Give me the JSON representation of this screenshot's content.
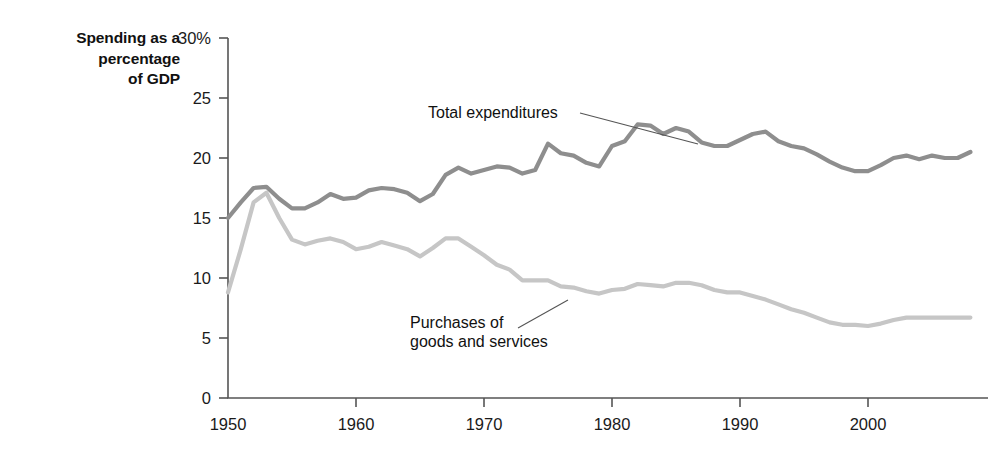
{
  "figure": {
    "axis_title": "Spending as a\npercentage\nof GDP"
  },
  "chart_data": {
    "type": "line",
    "title": "",
    "subtitle": "",
    "xlabel": "",
    "ylabel": "Spending as a percentage of GDP",
    "xlim": [
      1950,
      2008
    ],
    "ylim": [
      0,
      30
    ],
    "grid": false,
    "legend_position": "inline-annotations",
    "y_tick_labels": [
      "30%",
      "25",
      "20",
      "15",
      "10",
      "5",
      "0"
    ],
    "y_ticks": [
      30,
      25,
      20,
      15,
      10,
      5,
      0
    ],
    "x_tick_labels": [
      "1950",
      "1960",
      "1970",
      "1980",
      "1990",
      "2000"
    ],
    "x_ticks": [
      1950,
      1960,
      1970,
      1980,
      1990,
      2000
    ],
    "x": [
      1950,
      1951,
      1952,
      1953,
      1954,
      1955,
      1956,
      1957,
      1958,
      1959,
      1960,
      1961,
      1962,
      1963,
      1964,
      1965,
      1966,
      1967,
      1968,
      1969,
      1970,
      1971,
      1972,
      1973,
      1974,
      1975,
      1976,
      1977,
      1978,
      1979,
      1980,
      1981,
      1982,
      1983,
      1984,
      1985,
      1986,
      1987,
      1988,
      1989,
      1990,
      1991,
      1992,
      1993,
      1994,
      1995,
      1996,
      1997,
      1998,
      1999,
      2000,
      2001,
      2002,
      2003,
      2004,
      2005,
      2006,
      2007,
      2008
    ],
    "series": [
      {
        "name": "Total expenditures",
        "color": "#8e8e8e",
        "annotation": "Total expenditures",
        "values": [
          15.0,
          16.3,
          17.5,
          17.6,
          16.6,
          15.8,
          15.8,
          16.3,
          17.0,
          16.6,
          16.7,
          17.3,
          17.5,
          17.4,
          17.1,
          16.4,
          17.0,
          18.6,
          19.2,
          18.7,
          19.0,
          19.3,
          19.2,
          18.7,
          19.0,
          21.2,
          20.4,
          20.2,
          19.6,
          19.3,
          21.0,
          21.4,
          22.8,
          22.7,
          22.0,
          22.5,
          22.2,
          21.3,
          21.0,
          21.0,
          21.5,
          22.0,
          22.2,
          21.4,
          21.0,
          20.8,
          20.3,
          19.7,
          19.2,
          18.9,
          18.9,
          19.4,
          20.0,
          20.2,
          19.9,
          20.2,
          20.0,
          20.0,
          20.5
        ]
      },
      {
        "name": "Purchases of goods and services",
        "color": "#c6c6c6",
        "annotation": "Purchases of\ngoods and services",
        "values": [
          8.8,
          12.4,
          16.3,
          17.1,
          15.0,
          13.2,
          12.8,
          13.1,
          13.3,
          13.0,
          12.4,
          12.6,
          13.0,
          12.7,
          12.4,
          11.8,
          12.5,
          13.3,
          13.3,
          12.6,
          11.9,
          11.1,
          10.7,
          9.8,
          9.8,
          9.8,
          9.3,
          9.2,
          8.9,
          8.7,
          9.0,
          9.1,
          9.5,
          9.4,
          9.3,
          9.6,
          9.6,
          9.4,
          9.0,
          8.8,
          8.8,
          8.5,
          8.2,
          7.8,
          7.4,
          7.1,
          6.7,
          6.3,
          6.1,
          6.1,
          6.0,
          6.2,
          6.5,
          6.7,
          6.7,
          6.7,
          6.7,
          6.7,
          6.7
        ]
      }
    ]
  }
}
